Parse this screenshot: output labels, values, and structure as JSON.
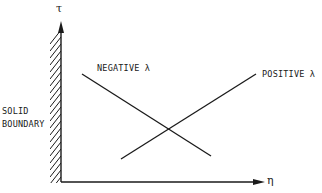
{
  "diagram": {
    "axes": {
      "y_label": "τ",
      "x_label": "η"
    },
    "boundary_label": {
      "line1": "SOLID",
      "line2": "BOUNDARY"
    },
    "lines": [
      {
        "name": "negative",
        "label": "NEGATIVE λ",
        "from": [
          82,
          74
        ],
        "to": [
          211,
          156
        ]
      },
      {
        "name": "positive",
        "label": "POSITIVE λ",
        "from": [
          121,
          159
        ],
        "to": [
          256,
          74
        ]
      }
    ],
    "colors": {
      "ink": "#1a1a1a",
      "background": "#ffffff"
    }
  }
}
